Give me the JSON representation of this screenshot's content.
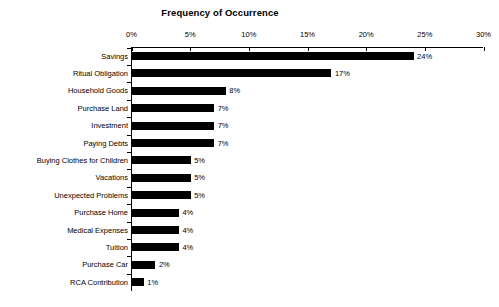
{
  "chart_data": {
    "type": "bar",
    "orientation": "horizontal",
    "title": "Frequency of Occurrence",
    "xlabel": "",
    "ylabel": "",
    "xlim": [
      0,
      30
    ],
    "xticks": [
      0,
      5,
      10,
      15,
      20,
      25,
      30
    ],
    "xtick_labels": [
      "0%",
      "5%",
      "10%",
      "15%",
      "20%",
      "25%",
      "30%"
    ],
    "grid": false,
    "legend": false,
    "bar_color": "#000000",
    "categories": [
      "Savings",
      "Ritual Obligation",
      "Household Goods",
      "Purchase Land",
      "Investment",
      "Paying Debts",
      "Buying Clothes for Children",
      "Vacations",
      "Unexpected Problems",
      "Purchase Home",
      "Medical Expenses",
      "Tuition",
      "Purchase Car",
      "RCA Contribution"
    ],
    "values": [
      24,
      17,
      8,
      7,
      7,
      7,
      5,
      5,
      5,
      4,
      4,
      4,
      2,
      1
    ],
    "value_labels": [
      "24%",
      "17%",
      "8%",
      "7%",
      "7%",
      "7%",
      "5%",
      "5%",
      "5%",
      "4%",
      "4%",
      "4%",
      "2%",
      "1%"
    ]
  }
}
